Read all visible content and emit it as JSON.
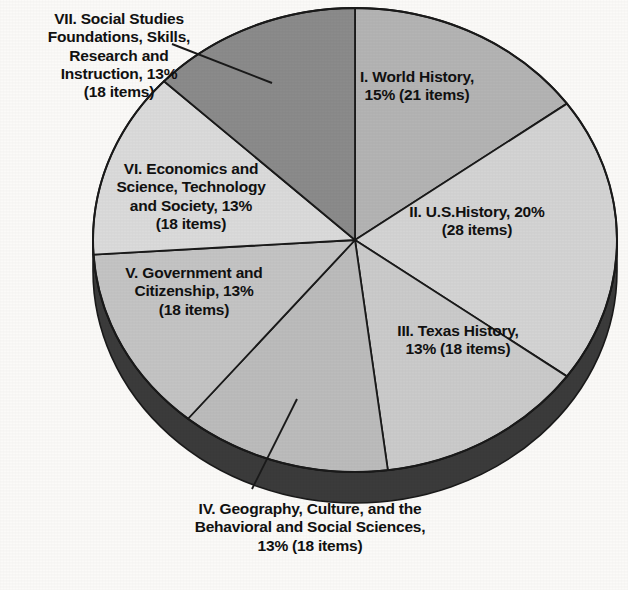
{
  "chart_data": {
    "type": "pie",
    "title": "",
    "subtitle": "",
    "xlabel": "",
    "ylabel": "",
    "legend_position": "none",
    "grid": false,
    "total_items": 139,
    "style": "3d-pie-with-depth-rim",
    "start_angle_deg": 0,
    "direction": "clockwise",
    "categories": [
      "I. World History",
      "II. U.S.History",
      "III. Texas History",
      "IV. Geography, Culture, and the Behavioral and Social Sciences",
      "V. Government and Citizenship",
      "VI. Economics and Science, Technology and Society",
      "VII. Social Studies Foundations, Skills, Research and Instruction"
    ],
    "values": [
      15,
      20,
      13,
      13,
      13,
      13,
      13
    ],
    "item_counts": [
      21,
      28,
      18,
      18,
      18,
      18,
      18
    ],
    "slices": [
      {
        "roman": "I",
        "name": "World History",
        "percent": 15,
        "items": 21,
        "label": "I. World History,\n15% (21 items)",
        "color": "#b4b4b4",
        "label_placement": "inside",
        "start_deg": 0,
        "end_deg": 54
      },
      {
        "roman": "II",
        "name": "U.S.History",
        "percent": 20,
        "items": 28,
        "label": "II. U.S.History, 20%\n(28 items)",
        "color": "#d4d4d4",
        "label_placement": "inside",
        "start_deg": 54,
        "end_deg": 126
      },
      {
        "roman": "III",
        "name": "Texas History",
        "percent": 13,
        "items": 18,
        "label": "III. Texas History,\n13% (18 items)",
        "color": "#cbcbcb",
        "label_placement": "inside",
        "start_deg": 126,
        "end_deg": 173
      },
      {
        "roman": "IV",
        "name": "Geography, Culture, and the Behavioral and Social Sciences",
        "percent": 13,
        "items": 18,
        "label": "IV. Geography, Culture, and the\nBehavioral and Social Sciences,\n13% (18 items)",
        "color": "#bcbcbc",
        "label_placement": "callout-below",
        "start_deg": 173,
        "end_deg": 220
      },
      {
        "roman": "V",
        "name": "Government and Citizenship",
        "percent": 13,
        "items": 18,
        "label": "V. Government and\nCitizenship, 13%\n(18 items)",
        "color": "#c4c4c4",
        "label_placement": "inside",
        "start_deg": 220,
        "end_deg": 267
      },
      {
        "roman": "VI",
        "name": "Economics and Science, Technology and Society",
        "percent": 13,
        "items": 18,
        "label": "VI. Economics and\nScience, Technology\nand Society, 13%\n(18 items)",
        "color": "#dbdbdb",
        "label_placement": "inside",
        "start_deg": 267,
        "end_deg": 314
      },
      {
        "roman": "VII",
        "name": "Social Studies Foundations, Skills, Research and Instruction",
        "percent": 13,
        "items": 18,
        "label": "VII. Social Studies\nFoundations, Skills,\nResearch and\nInstruction, 13%\n(18 items)",
        "color": "#8b8b8b",
        "label_placement": "callout-upper-left",
        "start_deg": 314,
        "end_deg": 360
      }
    ],
    "colors": {
      "rim_dark": "#3b3b3b",
      "outline": "#1a1a1a",
      "background": "#fbfaf8",
      "text": "#111111",
      "leader_line": "#1a1a1a"
    }
  }
}
